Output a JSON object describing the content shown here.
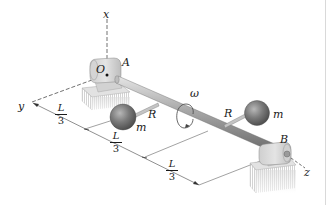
{
  "figure": {
    "labels": {
      "x_axis": "x",
      "y_axis": "y",
      "z_axis": "z",
      "origin": "O",
      "bearing_a": "A",
      "bearing_b": "B",
      "angular_velocity": "ω",
      "arm_left": "R",
      "arm_right": "R",
      "mass_left": "m",
      "mass_right": "m"
    },
    "dimensions": [
      {
        "numerator": "L",
        "denominator": "3"
      },
      {
        "numerator": "L",
        "denominator": "3"
      },
      {
        "numerator": "L",
        "denominator": "3"
      }
    ]
  }
}
